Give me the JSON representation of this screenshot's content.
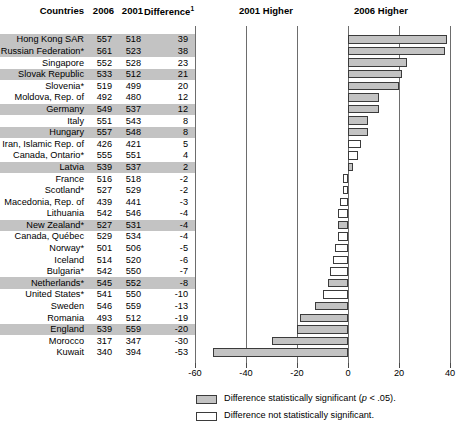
{
  "table": {
    "headers": {
      "country": "Countries",
      "y2006": "2006",
      "y2001": "2001",
      "difference": "Difference",
      "difference_footnote": "1"
    }
  },
  "plot": {
    "left_band_label": "2001 Higher",
    "right_band_label": "2006 Higher"
  },
  "legend": {
    "significant": "Difference statistically significant (",
    "significant_italic": "p",
    "significant_tail": " < .05).",
    "not_significant": "Difference not statistically significant."
  },
  "chart_data": {
    "type": "bar",
    "title": "",
    "subtitle": "",
    "xlabel": "",
    "ylabel": "",
    "orientation": "horizontal",
    "xlim": [
      -60,
      40
    ],
    "xticks": [
      -60,
      -40,
      -20,
      0,
      20,
      40
    ],
    "xtick_labels": [
      "-60",
      "-40",
      "-20",
      "0",
      "20",
      "40"
    ],
    "grid": true,
    "legend_position": "bottom",
    "columns": [
      "Countries",
      "2006",
      "2001",
      "Difference"
    ],
    "categories": [
      "Hong Kong SAR",
      "Russian Federation*",
      "Singapore",
      "Slovak Republic",
      "Slovenia*",
      "Moldova, Rep. of",
      "Germany",
      "Italy",
      "Hungary",
      "Iran, Islamic Rep. of",
      "Canada, Ontario*",
      "Latvia",
      "France",
      "Scotland*",
      "Macedonia, Rep. of",
      "Lithuania",
      "New Zealand*",
      "Canada, Québec",
      "Norway*",
      "Iceland",
      "Bulgaria*",
      "Netherlands*",
      "United States*",
      "Sweden",
      "Romania",
      "England",
      "Morocco",
      "Kuwait"
    ],
    "values": [
      39,
      38,
      23,
      21,
      20,
      12,
      12,
      8,
      8,
      5,
      4,
      2,
      -2,
      -2,
      -3,
      -4,
      -4,
      -4,
      -5,
      -6,
      -7,
      -8,
      -10,
      -13,
      -19,
      -20,
      -30,
      -53
    ],
    "series": [
      {
        "name": "2006",
        "values": [
          557,
          561,
          552,
          533,
          519,
          492,
          549,
          551,
          557,
          426,
          555,
          539,
          516,
          527,
          439,
          542,
          527,
          529,
          501,
          514,
          542,
          545,
          541,
          546,
          493,
          539,
          317,
          340
        ]
      },
      {
        "name": "2001",
        "values": [
          518,
          523,
          528,
          512,
          499,
          480,
          537,
          543,
          548,
          421,
          551,
          537,
          518,
          529,
          441,
          546,
          531,
          534,
          506,
          520,
          550,
          552,
          550,
          559,
          512,
          559,
          347,
          394
        ]
      }
    ],
    "significant": [
      true,
      true,
      true,
      true,
      true,
      true,
      true,
      true,
      true,
      false,
      false,
      true,
      false,
      false,
      false,
      false,
      true,
      false,
      false,
      false,
      false,
      true,
      false,
      true,
      true,
      true,
      true,
      true
    ],
    "row_shaded": [
      true,
      true,
      false,
      true,
      false,
      false,
      true,
      false,
      true,
      false,
      false,
      true,
      false,
      false,
      false,
      false,
      true,
      false,
      false,
      false,
      false,
      true,
      false,
      false,
      false,
      true,
      false,
      false
    ],
    "colors": {
      "significant_fill": "#c3c3c3",
      "not_significant_fill": "#ffffff",
      "bar_outline": "#3b3b3b",
      "gridline": "#6d6d6d",
      "row_shade": "#c3c3c3"
    }
  }
}
